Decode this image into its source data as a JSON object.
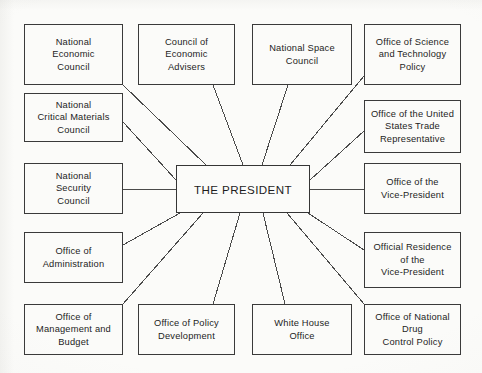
{
  "diagram": {
    "type": "organization-chart",
    "layout": "hub-and-spoke",
    "background_color": "#fbfbf9",
    "line_color": "#4a4a4a",
    "box_border_color": "#3a3a3a",
    "text_color": "#1d1d1d",
    "center": {
      "id": "president",
      "label": "THE PRESIDENT",
      "x": 176,
      "y": 165,
      "width": 134,
      "height": 48
    },
    "nodes": [
      {
        "id": "national-economic-council",
        "label": "National\nEconomic\nCouncil",
        "x": 24,
        "y": 24,
        "width": 99,
        "height": 61,
        "anchor": "bottom-right",
        "link_from": [
          123,
          85
        ],
        "link_to": [
          206,
          165
        ]
      },
      {
        "id": "council-of-economic-advisers",
        "label": "Council of\nEconomic\nAdvisers",
        "x": 138,
        "y": 24,
        "width": 97,
        "height": 61,
        "anchor": "bottom-right",
        "link_from": [
          213,
          85
        ],
        "link_to": [
          243,
          165
        ]
      },
      {
        "id": "national-space-council",
        "label": "National Space\nCouncil",
        "x": 252,
        "y": 24,
        "width": 100,
        "height": 61,
        "anchor": "bottom-left",
        "link_from": [
          288,
          85
        ],
        "link_to": [
          262,
          165
        ]
      },
      {
        "id": "office-of-science-and-technology-policy",
        "label": "Office of Science\nand Technology\nPolicy",
        "x": 364,
        "y": 24,
        "width": 97,
        "height": 61,
        "anchor": "bottom-left",
        "link_from": [
          364,
          76
        ],
        "link_to": [
          290,
          165
        ]
      },
      {
        "id": "national-critical-materials-council",
        "label": "National\nCritical Materials\nCouncil",
        "x": 24,
        "y": 93,
        "width": 99,
        "height": 49,
        "anchor": "right",
        "link_from": [
          123,
          122
        ],
        "link_to": [
          176,
          180
        ]
      },
      {
        "id": "office-of-the-united-states-trade-representative",
        "label": "Office of the United\nStates Trade\nRepresentative",
        "x": 364,
        "y": 100,
        "width": 97,
        "height": 53,
        "anchor": "left",
        "link_from": [
          364,
          131
        ],
        "link_to": [
          310,
          180
        ]
      },
      {
        "id": "national-security-council",
        "label": "National\nSecurity\nCouncil",
        "x": 24,
        "y": 163,
        "width": 99,
        "height": 51,
        "anchor": "right",
        "link_from": [
          123,
          189
        ],
        "link_to": [
          176,
          189
        ]
      },
      {
        "id": "office-of-the-vice-president",
        "label": "Office of the\nVice-President",
        "x": 364,
        "y": 163,
        "width": 97,
        "height": 51,
        "anchor": "left",
        "link_from": [
          364,
          189
        ],
        "link_to": [
          310,
          189
        ]
      },
      {
        "id": "office-of-administration",
        "label": "Office of\nAdministration",
        "x": 24,
        "y": 232,
        "width": 99,
        "height": 51,
        "anchor": "top-right",
        "link_from": [
          123,
          245
        ],
        "link_to": [
          180,
          213
        ]
      },
      {
        "id": "official-residence-of-the-vice-president",
        "label": "Official Residence\nof the\nVice-President",
        "x": 364,
        "y": 232,
        "width": 97,
        "height": 56,
        "anchor": "top-left",
        "link_from": [
          364,
          250
        ],
        "link_to": [
          308,
          213
        ]
      },
      {
        "id": "office-of-management-and-budget",
        "label": "Office of\nManagement and\nBudget",
        "x": 24,
        "y": 304,
        "width": 99,
        "height": 51,
        "anchor": "top-right",
        "link_from": [
          123,
          304
        ],
        "link_to": [
          203,
          213
        ]
      },
      {
        "id": "office-of-policy-development",
        "label": "Office of Policy\nDevelopment",
        "x": 138,
        "y": 304,
        "width": 97,
        "height": 51,
        "anchor": "top-right",
        "link_from": [
          213,
          304
        ],
        "link_to": [
          240,
          213
        ]
      },
      {
        "id": "white-house-office",
        "label": "White House\nOffice",
        "x": 252,
        "y": 304,
        "width": 100,
        "height": 51,
        "anchor": "top-left",
        "link_from": [
          285,
          304
        ],
        "link_to": [
          263,
          213
        ]
      },
      {
        "id": "office-of-national-drug-control-policy",
        "label": "Office of National\nDrug\nControl Policy",
        "x": 364,
        "y": 304,
        "width": 97,
        "height": 51,
        "anchor": "top-left",
        "link_from": [
          364,
          304
        ],
        "link_to": [
          287,
          213
        ]
      }
    ]
  }
}
